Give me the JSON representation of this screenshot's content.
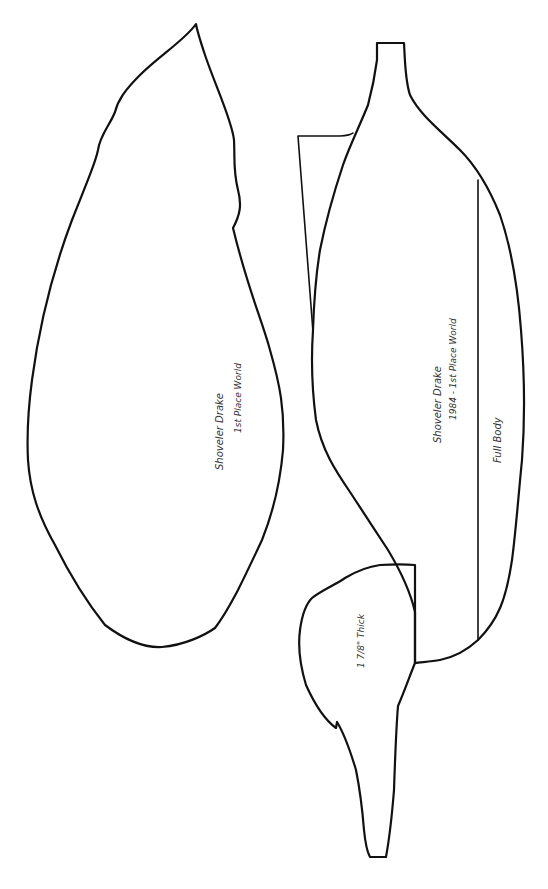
{
  "pattern": {
    "subject": "Shoveler Drake decoy carving pattern",
    "colors": {
      "background": "#ffffff",
      "stroke": "#111111",
      "text": "#333333"
    }
  },
  "top_view": {
    "label_line1": "Shoveler Drake",
    "label_line2": "1st Place World"
  },
  "side_view": {
    "label_line1": "Shoveler Drake",
    "label_line2": "1984 - 1st Place World",
    "section_label": "Full Body"
  },
  "head": {
    "thickness_label": "1 7/8\" Thick"
  }
}
